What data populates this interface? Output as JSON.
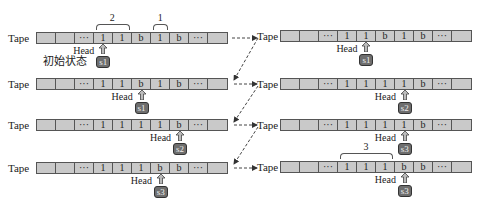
{
  "tape_label": "Tape",
  "head_label": "Head",
  "initial_state_label": "初始状态",
  "colors": {
    "cell_fill": "#c9c9c9",
    "cell_border": "#555555",
    "state_fill": "#6e6e6e"
  },
  "left": [
    {
      "cells": [
        "",
        "",
        "···",
        "1",
        "1",
        "b",
        "1",
        "b",
        "···",
        ""
      ],
      "head_index": 3,
      "state": "s1"
    },
    {
      "cells": [
        "",
        "",
        "···",
        "1",
        "1",
        "b",
        "1",
        "b",
        "···",
        ""
      ],
      "head_index": 5,
      "state": "s1"
    },
    {
      "cells": [
        "",
        "",
        "···",
        "1",
        "1",
        "1",
        "1",
        "b",
        "···",
        ""
      ],
      "head_index": 7,
      "state": "s2"
    },
    {
      "cells": [
        "",
        "",
        "···",
        "1",
        "1",
        "1",
        "b",
        "b",
        "···",
        ""
      ],
      "head_index": 6,
      "state": "s3"
    }
  ],
  "right": [
    {
      "cells": [
        "",
        "",
        "···",
        "1",
        "1",
        "b",
        "1",
        "b",
        "···",
        ""
      ],
      "head_index": 4,
      "state": "s1"
    },
    {
      "cells": [
        "",
        "",
        "···",
        "1",
        "1",
        "1",
        "1",
        "b",
        "···",
        ""
      ],
      "head_index": 6,
      "state": "s2"
    },
    {
      "cells": [
        "",
        "",
        "···",
        "1",
        "1",
        "1",
        "1",
        "b",
        "···",
        ""
      ],
      "head_index": 6,
      "state": "s3"
    },
    {
      "cells": [
        "",
        "",
        "···",
        "1",
        "1",
        "1",
        "b",
        "b",
        "···",
        ""
      ],
      "head_index": 6,
      "state": "s3"
    }
  ],
  "braces": [
    {
      "label": "2",
      "side": "left",
      "row": 0,
      "from": 3,
      "to": 4
    },
    {
      "label": "1",
      "side": "left",
      "row": 0,
      "from": 6,
      "to": 6
    },
    {
      "label": "3",
      "side": "right",
      "row": 3,
      "from": 3,
      "to": 5
    }
  ]
}
